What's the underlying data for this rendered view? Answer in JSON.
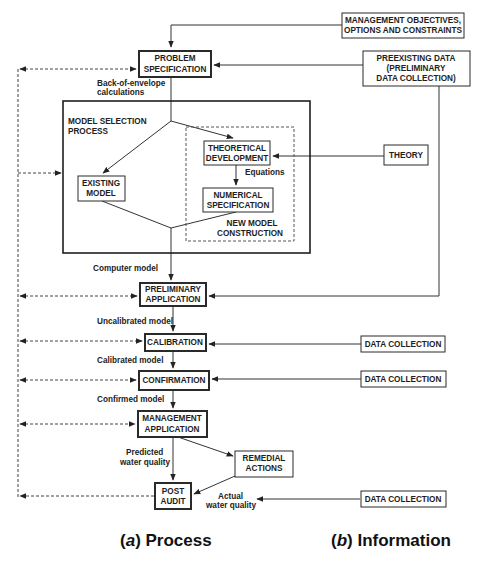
{
  "diagram": {
    "boxes": {
      "management_objectives": {
        "line1": "MANAGEMENT OBJECTIVES,",
        "line2": "OPTIONS AND CONSTRAINTS"
      },
      "problem_specification": {
        "line1": "PROBLEM",
        "line2": "SPECIFICATION"
      },
      "preexisting_data": {
        "line1": "PREEXISTING DATA",
        "line2": "(PRELIMINARY",
        "line3": "DATA COLLECTION)"
      },
      "model_selection": {
        "line1": "MODEL SELECTION",
        "line2": "PROCESS"
      },
      "theoretical_development": {
        "line1": "THEORETICAL",
        "line2": "DEVELOPMENT"
      },
      "existing_model": {
        "line1": "EXISTING",
        "line2": "MODEL"
      },
      "numerical_specification": {
        "line1": "NUMERICAL",
        "line2": "SPECIFICATION"
      },
      "new_model_construction": {
        "line1": "NEW MODEL",
        "line2": "CONSTRUCTION"
      },
      "theory": {
        "line1": "THEORY"
      },
      "preliminary_application": {
        "line1": "PRELIMINARY",
        "line2": "APPLICATION"
      },
      "calibration": {
        "line1": "CALIBRATION"
      },
      "confirmation": {
        "line1": "CONFIRMATION"
      },
      "management_application": {
        "line1": "MANAGEMENT",
        "line2": "APPLICATION"
      },
      "remedial_actions": {
        "line1": "REMEDIAL",
        "line2": "ACTIONS"
      },
      "post_audit": {
        "line1": "POST",
        "line2": "AUDIT"
      },
      "data_collection_1": {
        "line1": "DATA COLLECTION"
      },
      "data_collection_2": {
        "line1": "DATA COLLECTION"
      },
      "data_collection_3": {
        "line1": "DATA COLLECTION"
      }
    },
    "edge_labels": {
      "back_of_envelope": {
        "line1": "Back-of-envelope",
        "line2": "calculations"
      },
      "equations": "Equations",
      "computer_model": "Computer model",
      "uncalibrated_model": "Uncalibrated model",
      "calibrated_model": "Calibrated model",
      "confirmed_model": "Confirmed model",
      "predicted_water_quality": {
        "line1": "Predicted",
        "line2": "water quality"
      },
      "actual_water_quality": {
        "line1": "Actual",
        "line2": "water quality"
      }
    },
    "captions": {
      "process": {
        "paren_open": "(",
        "letter": "a",
        "paren_close": ")",
        "text": " Process"
      },
      "information": {
        "paren_open": "(",
        "letter": "b",
        "paren_close": ")",
        "text": " Information"
      }
    }
  }
}
